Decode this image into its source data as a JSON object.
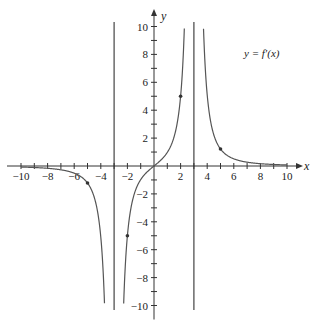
{
  "chart_data": {
    "type": "line",
    "title": "",
    "xlabel": "x",
    "ylabel": "y",
    "xlim": [
      -10,
      10
    ],
    "ylim": [
      -10,
      10
    ],
    "grid": false,
    "x_ticks": [
      -10,
      -9,
      -8,
      -7,
      -6,
      -5,
      -4,
      -3,
      -2,
      -1,
      1,
      2,
      3,
      4,
      5,
      6,
      7,
      8,
      9,
      10
    ],
    "x_tick_labels": [
      -10,
      -8,
      -6,
      -4,
      -2,
      2,
      4,
      6,
      8,
      10
    ],
    "y_ticks": [
      -10,
      -9,
      -8,
      -7,
      -6,
      -5,
      -4,
      -3,
      -2,
      -1,
      1,
      2,
      3,
      4,
      5,
      6,
      7,
      8,
      9,
      10
    ],
    "y_tick_labels": [
      -10,
      -8,
      -6,
      -4,
      -2,
      2,
      4,
      6,
      8,
      10
    ],
    "annotation": "y = f′(x)",
    "vertical_asymptotes": [
      -3,
      3
    ],
    "series": [
      {
        "name": "y = f′(x)",
        "description": "odd function, approx 62.5·x/(x²−9)²",
        "branches": [
          {
            "domain": [
              -10,
              -3
            ],
            "points": [
              [
                -10,
                -0.07
              ],
              [
                -9,
                -0.11
              ],
              [
                -8,
                -0.16
              ],
              [
                -7,
                -0.27
              ],
              [
                -6,
                -0.46
              ],
              [
                -5,
                -1.22
              ],
              [
                -4,
                -5.1
              ],
              [
                -3.6,
                -14.5
              ]
            ]
          },
          {
            "domain": [
              -3,
              3
            ],
            "points": [
              [
                -2.4,
                -14.7
              ],
              [
                -2,
                -5.0
              ],
              [
                -1.5,
                -1.83
              ],
              [
                -1,
                -0.98
              ],
              [
                -0.5,
                -0.45
              ],
              [
                0,
                0
              ],
              [
                0.5,
                0.45
              ],
              [
                1,
                0.98
              ],
              [
                1.5,
                1.83
              ],
              [
                2,
                5.0
              ],
              [
                2.4,
                14.7
              ]
            ]
          },
          {
            "domain": [
              3,
              10
            ],
            "points": [
              [
                3.6,
                14.5
              ],
              [
                4,
                5.1
              ],
              [
                5,
                1.22
              ],
              [
                6,
                0.46
              ],
              [
                7,
                0.27
              ],
              [
                8,
                0.16
              ],
              [
                9,
                0.11
              ],
              [
                10,
                0.07
              ]
            ]
          }
        ],
        "marked_points": [
          [
            -5,
            -1.22
          ],
          [
            -2,
            -5
          ],
          [
            2,
            5
          ],
          [
            5,
            1.22
          ]
        ]
      }
    ]
  }
}
